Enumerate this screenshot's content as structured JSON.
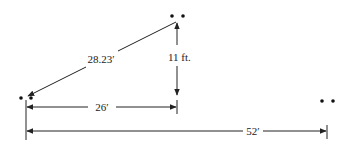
{
  "diagram": {
    "type": "distance-diagram",
    "labels": {
      "hypotenuse": "28.23′",
      "height": "11 ft.",
      "horizontal_short": "26′",
      "horizontal_long": "52′"
    },
    "measurements": {
      "hypotenuse_ft": 28.23,
      "height_ft": 11,
      "horizontal_short_ft": 26,
      "horizontal_long_ft": 52
    },
    "points": [
      {
        "id": "left",
        "marker": "two-dots"
      },
      {
        "id": "top",
        "marker": "two-dots"
      },
      {
        "id": "right",
        "marker": "two-dots"
      }
    ]
  }
}
